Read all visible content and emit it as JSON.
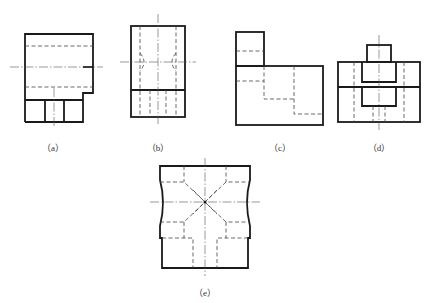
{
  "figure": {
    "type": "orthographic-views",
    "panels": [
      {
        "id": "a",
        "label": "（a）",
        "label_x": 53,
        "label_y": 141
      },
      {
        "id": "b",
        "label": "（b）",
        "label_x": 158,
        "label_y": 141
      },
      {
        "id": "c",
        "label": "（c）",
        "label_x": 280,
        "label_y": 141
      },
      {
        "id": "d",
        "label": "（d）",
        "label_x": 379,
        "label_y": 141
      },
      {
        "id": "e",
        "label": "（e）",
        "label_x": 205,
        "label_y": 286
      }
    ],
    "colors": {
      "line": "#1a1a1a",
      "background": "#ffffff"
    }
  }
}
